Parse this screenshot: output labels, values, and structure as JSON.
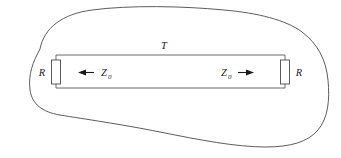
{
  "figure": {
    "type": "circuit-diagram",
    "background_color": "#ffffff",
    "line_color": "#3a3a3a",
    "text_color": "#1a1a1a",
    "enclosure": {
      "name": "closed-surface-blob",
      "stroke": "#4a4a4a",
      "fill": "none",
      "stroke_width": 0.9
    },
    "transmission_line": {
      "label": "T",
      "stroke": "#6b6b6b",
      "stroke_width": 1.0
    },
    "resistor_left": {
      "label": "R",
      "stroke": "#4a4a4a"
    },
    "resistor_right": {
      "label": "R",
      "stroke": "#4a4a4a"
    },
    "impedance_left": {
      "label": "Z",
      "subscript": "0",
      "arrow_direction": "left"
    },
    "impedance_right": {
      "label": "Z",
      "subscript": "0",
      "arrow_direction": "right"
    }
  }
}
